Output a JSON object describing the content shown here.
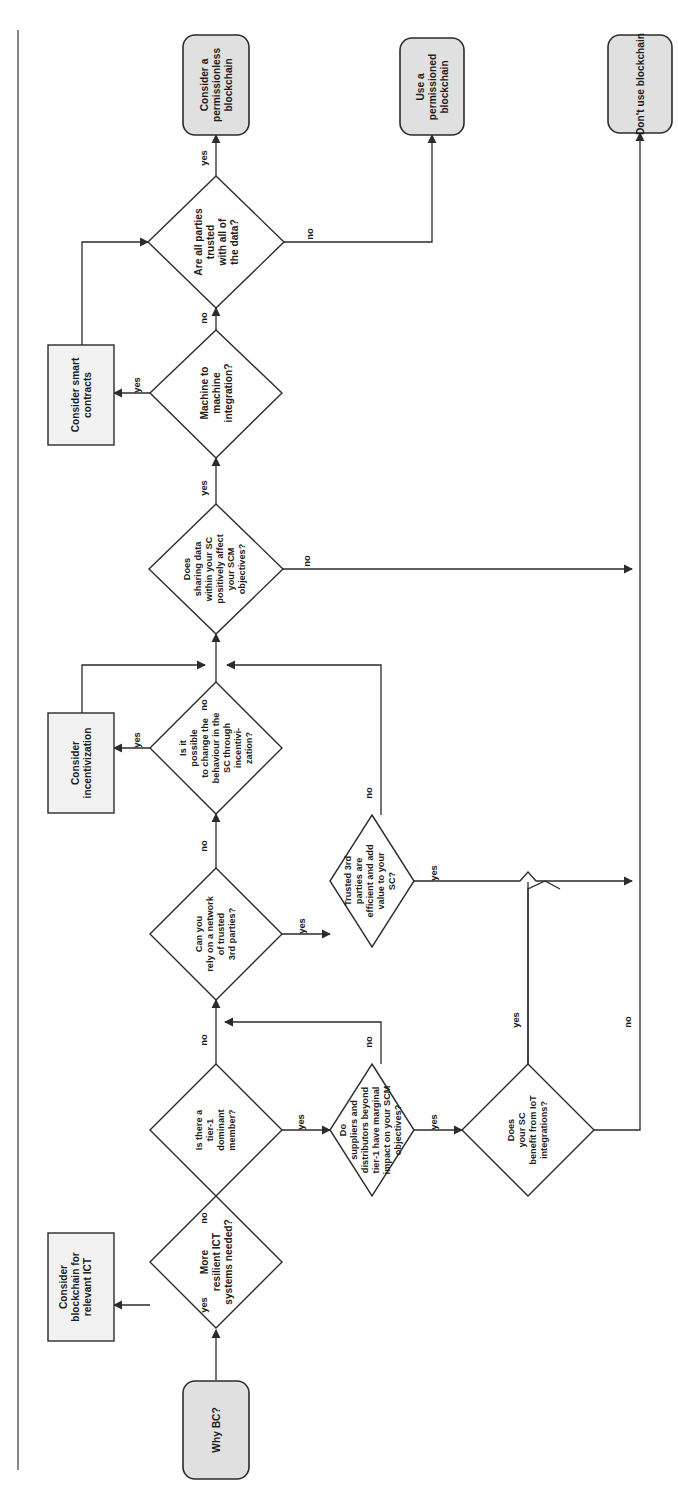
{
  "diagram": {
    "orientation": "rotated-90-ccw",
    "colors": {
      "terminator_fill": "#e0e0e0",
      "process_fill": "#f2f2f2",
      "decision_fill": "#ffffff",
      "stroke": "#2b2b2b",
      "text": "#1c1c1c",
      "frame": "#555555"
    },
    "nodes": [
      {
        "id": "start",
        "type": "terminator",
        "lines": [
          "Why BC?"
        ]
      },
      {
        "id": "d_ict",
        "type": "decision",
        "lines": [
          "More",
          "resilient ICT",
          "systems needed?"
        ]
      },
      {
        "id": "p_ict",
        "type": "process",
        "lines": [
          "Consider",
          "blockchain for",
          "relevant ICT",
          "systems"
        ]
      },
      {
        "id": "d_tier1",
        "type": "decision",
        "lines": [
          "Is there a",
          "tier-1",
          "dominant",
          "member?"
        ]
      },
      {
        "id": "d_suppliers",
        "type": "decision",
        "lines": [
          "Do",
          "suppliers and",
          "distributors beyond",
          "tier-1 have marginal",
          "impact on your SCM",
          "objectives?"
        ]
      },
      {
        "id": "d_iot",
        "type": "decision",
        "lines": [
          "Does",
          "your SC",
          "benefit from IoT",
          "integrations?"
        ]
      },
      {
        "id": "d_network",
        "type": "decision",
        "lines": [
          "Can you",
          "rely on a network",
          "of trusted",
          "3rd parties?"
        ]
      },
      {
        "id": "d_third",
        "type": "decision",
        "lines": [
          "Trusted 3rd",
          "parties are",
          "efficient and add",
          "value to your",
          "SC?"
        ]
      },
      {
        "id": "d_incent",
        "type": "decision",
        "lines": [
          "Is it",
          "possible",
          "to change the",
          "behaviour in the",
          "SC through",
          "incentivi-",
          "zation?"
        ]
      },
      {
        "id": "p_incent",
        "type": "process",
        "lines": [
          "Consider",
          "incentivization"
        ]
      },
      {
        "id": "d_sharing",
        "type": "decision",
        "lines": [
          "Does",
          "sharing data",
          "within your SC",
          "positively affect",
          "your SCM",
          "objectives?"
        ]
      },
      {
        "id": "d_m2m",
        "type": "decision",
        "lines": [
          "Machine to",
          "machine",
          "integration?"
        ]
      },
      {
        "id": "p_smart",
        "type": "process",
        "lines": [
          "Consider smart",
          "contracts"
        ]
      },
      {
        "id": "d_trustdata",
        "type": "decision",
        "lines": [
          "Are all parties",
          "trusted",
          "with all of",
          "the data?"
        ]
      },
      {
        "id": "t_permless",
        "type": "terminator",
        "lines": [
          "Consider a",
          "permissionless",
          "blockchain"
        ]
      },
      {
        "id": "t_perm",
        "type": "terminator",
        "lines": [
          "Use a",
          "permissioned",
          "blockchain"
        ]
      },
      {
        "id": "t_none",
        "type": "terminator",
        "lines": [
          "Don't use blockchain"
        ]
      }
    ],
    "edge_labels": {
      "ict_yes": "yes",
      "ict_no": "no",
      "tier1_yes": "yes",
      "tier1_no": "no",
      "suppliers_yes": "yes",
      "suppliers_no": "no",
      "iot_yes": "yes",
      "iot_no": "no",
      "network_yes": "yes",
      "network_no": "no",
      "third_yes": "yes",
      "third_no": "no",
      "incent_yes": "yes",
      "incent_no": "no",
      "sharing_yes": "yes",
      "sharing_no": "no",
      "m2m_yes": "yes",
      "m2m_no": "no",
      "trustdata_yes": "yes",
      "trustdata_no": "no"
    },
    "edges": [
      {
        "from": "start",
        "to": "d_ict",
        "label": ""
      },
      {
        "from": "d_ict",
        "to": "p_ict",
        "label": "yes"
      },
      {
        "from": "d_ict",
        "to": "d_tier1",
        "label": "no"
      },
      {
        "from": "d_tier1",
        "to": "d_suppliers",
        "label": "yes"
      },
      {
        "from": "d_tier1",
        "to": "d_network",
        "label": "no"
      },
      {
        "from": "d_suppliers",
        "to": "d_iot",
        "label": "yes"
      },
      {
        "from": "d_suppliers",
        "to": "d_network",
        "label": "no"
      },
      {
        "from": "d_iot",
        "to": "d_third_join",
        "label": "yes"
      },
      {
        "from": "d_iot",
        "to": "t_none",
        "label": "no"
      },
      {
        "from": "d_network",
        "to": "d_third",
        "label": "yes"
      },
      {
        "from": "d_network",
        "to": "d_incent",
        "label": "no"
      },
      {
        "from": "d_third",
        "to": "t_none",
        "label": "yes"
      },
      {
        "from": "d_third",
        "to": "d_incent",
        "label": "no"
      },
      {
        "from": "d_incent",
        "to": "p_incent",
        "label": "yes"
      },
      {
        "from": "d_incent",
        "to": "d_sharing",
        "label": "no"
      },
      {
        "from": "d_sharing",
        "to": "d_m2m",
        "label": "yes"
      },
      {
        "from": "d_sharing",
        "to": "t_none",
        "label": "no"
      },
      {
        "from": "d_m2m",
        "to": "p_smart",
        "label": "yes"
      },
      {
        "from": "d_m2m",
        "to": "d_trustdata",
        "label": "no"
      },
      {
        "from": "d_trustdata",
        "to": "t_permless",
        "label": "yes"
      },
      {
        "from": "d_trustdata",
        "to": "t_perm",
        "label": "no"
      }
    ]
  }
}
